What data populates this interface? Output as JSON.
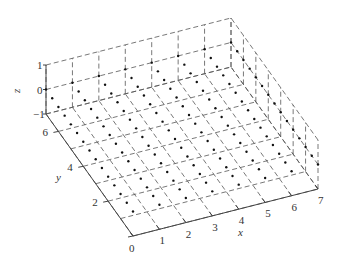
{
  "chart_data": {
    "type": "scatter",
    "title": "",
    "projection": "3d",
    "xlabel": "x",
    "ylabel": "y",
    "zlabel": "z",
    "xlim": [
      0,
      7
    ],
    "ylim": [
      0,
      7
    ],
    "zlim": [
      -1,
      1
    ],
    "x_ticks": [
      "0",
      "1",
      "2",
      "3",
      "4",
      "5",
      "6",
      "7"
    ],
    "y_ticks": [
      "2",
      "4",
      "6"
    ],
    "z_ticks": [
      "−1",
      "0",
      "1"
    ],
    "grid": true,
    "grid_style": "dashed",
    "points_description": "grid of points on plane z=0, x=0..7 step 1, y=0..7 step 0.5",
    "x_values": [
      0,
      1,
      2,
      3,
      4,
      5,
      6,
      7
    ],
    "y_values": [
      0,
      0.5,
      1,
      1.5,
      2,
      2.5,
      3,
      3.5,
      4,
      4.5,
      5,
      5.5,
      6,
      6.5,
      7
    ],
    "z_value": 0
  }
}
